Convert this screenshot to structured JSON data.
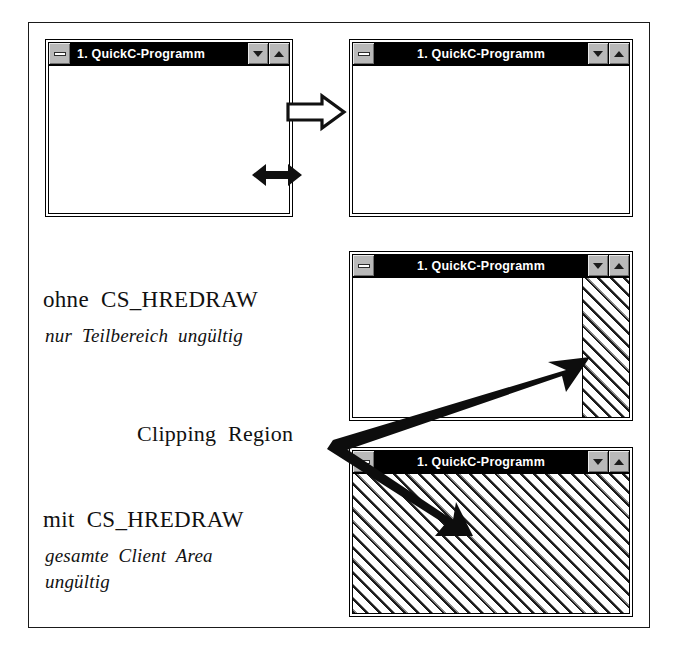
{
  "figure": {
    "window_title": "1. QuickC-Programm",
    "windows": [
      {
        "id": "window-before-resize",
        "title": "1. QuickC-Programm",
        "title_align": "left",
        "fill": "empty",
        "buttons": [
          "minimize-box",
          "restore-down-button",
          "maximize-up-button"
        ]
      },
      {
        "id": "window-after-resize",
        "title": "1. QuickC-Programm",
        "title_align": "center",
        "fill": "empty",
        "buttons": [
          "minimize-box",
          "restore-down-button",
          "maximize-up-button"
        ]
      },
      {
        "id": "window-without-hredraw",
        "title": "1. QuickC-Programm",
        "title_align": "center",
        "fill": "hatched-right-strip",
        "buttons": [
          "minimize-box",
          "restore-down-button",
          "maximize-up-button"
        ]
      },
      {
        "id": "window-with-hredraw",
        "title": "1. QuickC-Programm",
        "title_align": "center",
        "fill": "hatched-full",
        "buttons": [
          "minimize-box",
          "restore-down-button",
          "maximize-up-button"
        ]
      }
    ],
    "labels": {
      "without_heading": "ohne  CS_HREDRAW",
      "without_sub": "nur  Teilbereich  ungültig",
      "clipping_region": "Clipping  Region",
      "with_heading": "mit  CS_HREDRAW",
      "with_sub_line1": "gesamte  Client  Area",
      "with_sub_line2": "ungültig"
    },
    "arrows": {
      "transform_arrow": "hollow-right-arrow",
      "resize_arrow": "double-headed-horizontal-arrow",
      "pointer_up": "solid-arrow-up-right",
      "pointer_down": "solid-arrow-down-right"
    },
    "colors": {
      "titlebar_bg": "#000000",
      "titlebar_text": "#ffffff",
      "button_face": "#b9b9b9",
      "hatch_line": "#1d1d1d",
      "frame_border": "#1a1a1a",
      "page_bg": "#ffffff"
    }
  }
}
